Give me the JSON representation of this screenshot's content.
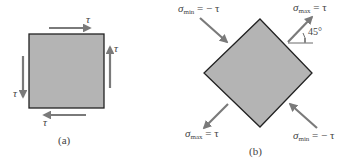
{
  "figure_a": {
    "caption": "(a)",
    "labels": {
      "top": "τ",
      "right": "τ",
      "left": "τ",
      "bottom": "τ"
    }
  },
  "figure_b": {
    "caption": "(b)",
    "angle": "45°",
    "labels": {
      "top_left": {
        "sym": "σ",
        "sub": "min",
        "rhs": "= − τ"
      },
      "top_right": {
        "sym": "σ",
        "sub": "max",
        "rhs": "=  τ"
      },
      "bottom_left": {
        "sym": "σ",
        "sub": "max",
        "rhs": "=  τ"
      },
      "bottom_right": {
        "sym": "σ",
        "sub": "min",
        "rhs": "= − τ"
      }
    }
  },
  "colors": {
    "fill": "#b4b4b4",
    "edge": "#222222",
    "arrow": "#7a7a7a"
  }
}
